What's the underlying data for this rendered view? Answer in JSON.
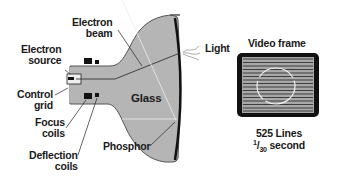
{
  "diagram": {
    "labels": {
      "electron_beam": [
        "Electron",
        "beam"
      ],
      "electron_source": [
        "Electron",
        "source"
      ],
      "control_grid": [
        "Control",
        "grid"
      ],
      "focus_coils": [
        "Focus",
        "coils"
      ],
      "deflection_coils": [
        "Deflection",
        "coils"
      ],
      "glass": "Glass",
      "phosphor": "Phosphor",
      "light": "Light"
    },
    "video_frame": {
      "title": "Video frame",
      "lines": "525 Lines",
      "time_numerator": "1",
      "time_denominator": "30",
      "time_unit": "second",
      "scan_line_count": 16
    },
    "colors": {
      "glass_fill": "#b5b5b5",
      "outline": "#1a1a1a",
      "frame_fill": "#a8a8a8",
      "text": "#1a1a1a"
    }
  }
}
